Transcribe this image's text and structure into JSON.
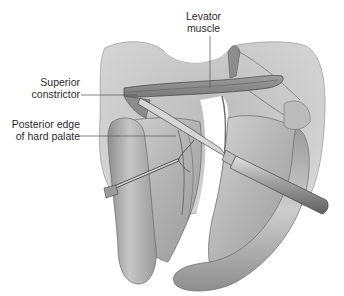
{
  "figure": {
    "style": "grayscale surgical illustration",
    "colors": {
      "background": "#ffffff",
      "tissue_light": "#c9c9c9",
      "tissue_mid": "#a9a9a9",
      "tissue_dark": "#8a8a8a",
      "outline": "#5c5c5c",
      "label_text": "#2a2a2a",
      "leader_line": "#555555"
    }
  },
  "labels": {
    "levator": {
      "line1": "Levator",
      "line2": "muscle"
    },
    "superior": {
      "line1": "Superior",
      "line2": "constrictor"
    },
    "posterior": {
      "line1": "Posterior edge",
      "line2": "of hard palate"
    }
  },
  "instruments": [
    {
      "name": "elevator",
      "description": "periosteal elevator with handle"
    },
    {
      "name": "hook",
      "description": "fine retraction hook"
    }
  ]
}
